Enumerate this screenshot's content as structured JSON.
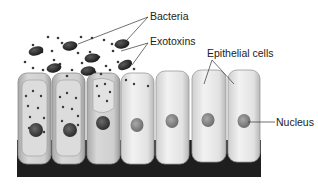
{
  "figure": {
    "labels": {
      "bacteria": "Bacteria",
      "exotoxins": "Exotoxins",
      "epithelial_cells": "Epithelial cells",
      "nucleus": "Nucleus"
    },
    "colors": {
      "background": "#ffffff",
      "base": "#1e1e1e",
      "cell_healthy": "#e4e4e4",
      "cell_damaged": "#c9c9c9",
      "bacteria": "#2a2a2a",
      "toxin": "#3a3a3a",
      "nucleus": "#8a8a8a"
    },
    "cells": [
      {
        "index": 1,
        "state": "damaged"
      },
      {
        "index": 2,
        "state": "damaged"
      },
      {
        "index": 3,
        "state": "damaged"
      },
      {
        "index": 4,
        "state": "healthy"
      },
      {
        "index": 5,
        "state": "healthy"
      },
      {
        "index": 6,
        "state": "healthy"
      },
      {
        "index": 7,
        "state": "healthy"
      }
    ]
  }
}
